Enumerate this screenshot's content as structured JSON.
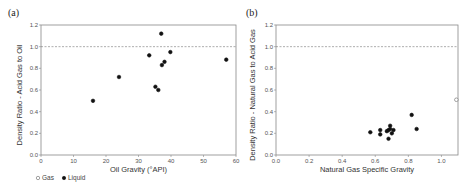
{
  "legend": {
    "items": [
      {
        "label": "Gas",
        "marker": "open-circle"
      },
      {
        "label": "Liquid",
        "marker": "filled-circle"
      }
    ]
  },
  "chart_data": [
    {
      "panel_label": "(a)",
      "type": "scatter",
      "title": "",
      "xlabel": "Oil Gravity (°API)",
      "ylabel": "Density Ratio - Acid Gas to Oil",
      "xlim": [
        0,
        60
      ],
      "ylim": [
        0.0,
        1.2
      ],
      "xticks": [
        "0",
        "10",
        "20",
        "30",
        "40",
        "50",
        "60"
      ],
      "yticks": [
        "0.0",
        "0.2",
        "0.4",
        "0.6",
        "0.8",
        "1.0",
        "1.2"
      ],
      "reference_line": {
        "y": 1.0,
        "style": "dashed"
      },
      "grid": false,
      "series": [
        {
          "name": "Liquid",
          "marker": "filled-circle",
          "points": [
            [
              16,
              0.5
            ],
            [
              24,
              0.72
            ],
            [
              33.3,
              0.92
            ],
            [
              35.2,
              0.63
            ],
            [
              36.1,
              0.6
            ],
            [
              37,
              1.12
            ],
            [
              37.2,
              0.83
            ],
            [
              38,
              0.86
            ],
            [
              39.8,
              0.95
            ],
            [
              57,
              0.88
            ]
          ]
        },
        {
          "name": "Gas",
          "marker": "open-circle",
          "points": []
        }
      ]
    },
    {
      "panel_label": "(b)",
      "type": "scatter",
      "title": "",
      "xlabel": "Natural Gas Specific Gravity",
      "ylabel": "Density Ratio - Natural Gas to Acid Gas",
      "xlim": [
        0.0,
        1.1
      ],
      "ylim": [
        0.0,
        1.2
      ],
      "xticks": [
        "0.0",
        "0.2",
        "0.4",
        "0.6",
        "0.8",
        "1.0"
      ],
      "yticks": [
        "0.0",
        "0.2",
        "0.4",
        "0.6",
        "0.8",
        "1.0",
        "1.2"
      ],
      "reference_line": {
        "y": 1.0,
        "style": "dashed"
      },
      "grid": false,
      "series": [
        {
          "name": "Liquid",
          "marker": "filled-circle",
          "points": [
            [
              0.57,
              0.21
            ],
            [
              0.63,
              0.23
            ],
            [
              0.63,
              0.19
            ],
            [
              0.67,
              0.22
            ],
            [
              0.68,
              0.23
            ],
            [
              0.68,
              0.15
            ],
            [
              0.69,
              0.24
            ],
            [
              0.69,
              0.27
            ],
            [
              0.7,
              0.2
            ],
            [
              0.71,
              0.23
            ],
            [
              0.82,
              0.37
            ],
            [
              0.85,
              0.24
            ]
          ]
        },
        {
          "name": "Gas",
          "marker": "open-circle",
          "points": [
            [
              1.09,
              0.51
            ]
          ]
        }
      ]
    }
  ]
}
